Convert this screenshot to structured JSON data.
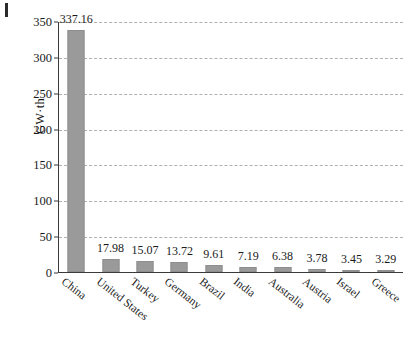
{
  "figure": {
    "corner_mark": "page-edge-mark"
  },
  "chart_data": {
    "type": "bar",
    "title": "",
    "subtitle": "",
    "xlabel": "",
    "ylabel": "GW·th",
    "ylim": [
      0,
      350
    ],
    "yticks": [
      0,
      50,
      100,
      150,
      200,
      250,
      300,
      350
    ],
    "ytick_labels": [
      "0",
      "50",
      "100",
      "150",
      "200",
      "250",
      "300",
      "350"
    ],
    "grid": true,
    "grid_style": "dashed-horizontal",
    "legend": null,
    "bar_color": "#9a9a9a",
    "categories": [
      "China",
      "United States",
      "Turkey",
      "Germany",
      "Brazil",
      "India",
      "Australia",
      "Austria",
      "Israel",
      "Greece"
    ],
    "values": [
      337.16,
      17.98,
      15.07,
      13.72,
      9.61,
      7.19,
      6.38,
      3.78,
      3.45,
      3.29
    ],
    "value_labels": [
      "337.16",
      "17.98",
      "15.07",
      "13.72",
      "9.61",
      "7.19",
      "6.38",
      "3.78",
      "3.45",
      "3.29"
    ]
  }
}
